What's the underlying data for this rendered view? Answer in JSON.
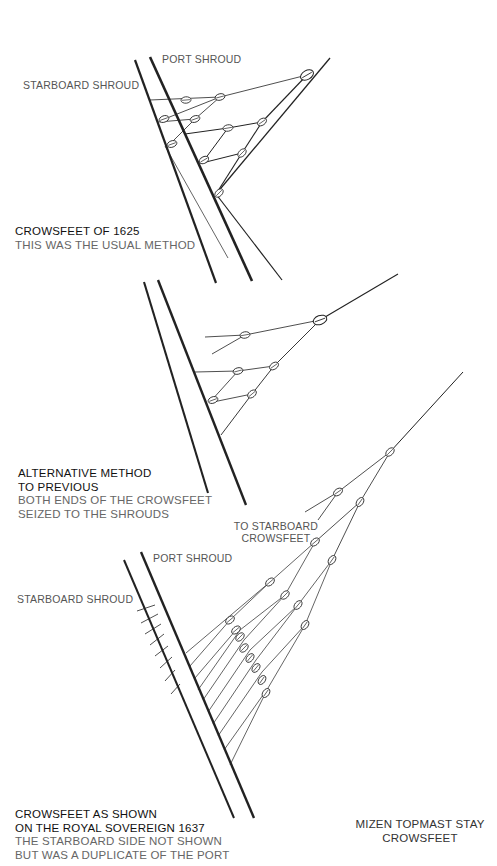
{
  "diagram1": {
    "labels": {
      "port_shroud": "PORT SHROUD",
      "starboard_shroud": "STARBOARD SHROUD"
    },
    "caption": {
      "title": "CROWSFEET OF 1625",
      "subtitle": "THIS WAS THE USUAL METHOD"
    }
  },
  "diagram2": {
    "caption": {
      "title_line1": "ALTERNATIVE METHOD",
      "title_line2": "TO PREVIOUS",
      "subtitle_line1": "BOTH ENDS OF THE CROWSFEET",
      "subtitle_line2": "SEIZED TO THE SHROUDS"
    }
  },
  "diagram3": {
    "labels": {
      "port_shroud": "PORT SHROUD",
      "starboard_shroud": "STARBOARD SHROUD",
      "to_starboard_line1": "TO STARBOARD",
      "to_starboard_line2": "CROWSFEET"
    },
    "caption": {
      "title_line1": "CROWSFEET AS SHOWN",
      "title_line2": "ON THE ROYAL SOVEREIGN 1637",
      "subtitle_line1": "THE STARBOARD SIDE NOT SHOWN",
      "subtitle_line2": "BUT WAS A DUPLICATE OF THE PORT"
    }
  },
  "diagram4": {
    "caption": {
      "line1": "MIZEN TOPMAST STAY",
      "line2": "CROWSFEET"
    }
  }
}
